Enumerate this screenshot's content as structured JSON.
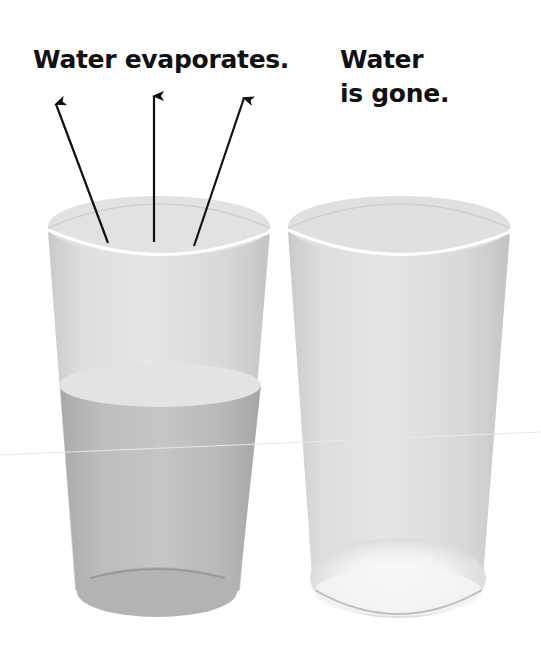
{
  "labels": {
    "left": "Water evaporates.",
    "right_line1": "Water",
    "right_line2": "is gone."
  },
  "glasses": [
    {
      "name": "glass-with-water",
      "state": "partially filled",
      "water_level": "about half"
    },
    {
      "name": "empty-glass",
      "state": "empty",
      "residue": "white residue at bottom"
    }
  ],
  "arrows": {
    "count": 3,
    "direction": "upward out of left glass",
    "meaning": "evaporation"
  },
  "colors": {
    "text": "#111111",
    "arrow": "#111111",
    "glass": "#d9d9d9",
    "water": "#bdbdbd",
    "water_surface": "#e4e4e4",
    "residue": "#f6f6f6",
    "background": "#ffffff"
  }
}
